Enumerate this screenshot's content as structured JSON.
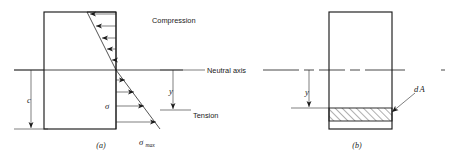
{
  "figure": {
    "panels": [
      {
        "id": "a",
        "caption": "(a)",
        "caption_x": 101,
        "caption_y": 148,
        "section": {
          "x": 44,
          "y": 12,
          "width": 72,
          "height": 117
        },
        "neutral_axis_y": 70,
        "labels": {
          "compression": "Compression",
          "neutral_axis": "Neutral axis",
          "tension": "Tension",
          "sigma": "σ",
          "sigma_max_base": "σ",
          "sigma_max_sub": "max",
          "dim_c": "c",
          "dim_y": "y"
        },
        "compression_arrows": 5,
        "tension_arrows": 4,
        "stress_profile": {
          "top_outer_x": 87,
          "neutral_x": 116,
          "bottom_outer_x": 160
        }
      },
      {
        "id": "b",
        "caption": "(b)",
        "caption_x": 357,
        "caption_y": 148,
        "section": {
          "x": 329,
          "y": 12,
          "width": 63,
          "height": 117
        },
        "neutral_axis_y": 70,
        "element_strip": {
          "x": 329,
          "y": 108,
          "width": 63,
          "height": 13
        },
        "labels": {
          "dA_base": "d",
          "dA_italic": "A",
          "dim_y": "y"
        }
      }
    ],
    "colors": {
      "ink": "#1a1a1a",
      "background": "#ffffff",
      "hatch": "#1a1a1a"
    }
  }
}
